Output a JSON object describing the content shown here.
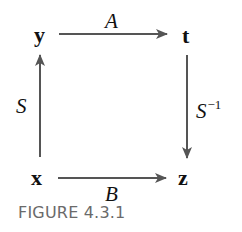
{
  "diagram": {
    "nodes": {
      "top_left": "y",
      "top_right": "t",
      "bottom_left": "x",
      "bottom_right": "z"
    },
    "edges": {
      "top": {
        "label": "A",
        "from": "y",
        "to": "t"
      },
      "bottom": {
        "label": "B",
        "from": "x",
        "to": "z"
      },
      "left": {
        "label": "S",
        "from": "x",
        "to": "y"
      },
      "right": {
        "label": "S",
        "superscript": "−1",
        "from": "t",
        "to": "z"
      }
    },
    "arrow_color": "#555555",
    "text_color": "#111111"
  },
  "caption": "FIGURE 4.3.1",
  "caption_color": "#6a6a6a"
}
